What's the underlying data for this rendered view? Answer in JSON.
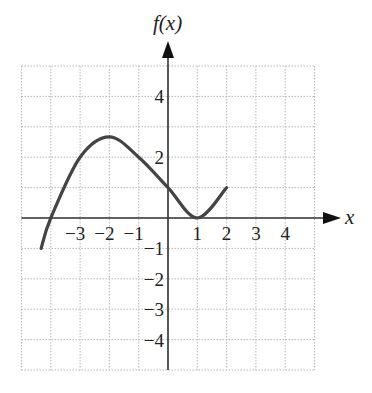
{
  "chart_data": {
    "type": "line",
    "title": "",
    "xlabel": "x",
    "ylabel": "f(x)",
    "xlim": [
      -5,
      5
    ],
    "ylim": [
      -5,
      5
    ],
    "grid": true,
    "x_ticks": [
      -3,
      -2,
      -1,
      1,
      2,
      3,
      4
    ],
    "y_ticks": [
      4,
      2,
      -1,
      -2,
      -3,
      -4
    ],
    "x_tick_labels": [
      "−3",
      "−2",
      "−1",
      "1",
      "2",
      "3",
      "4"
    ],
    "y_tick_labels": [
      "4",
      "2",
      "−1",
      "−2",
      "−3",
      "−4"
    ],
    "series": [
      {
        "name": "f(x)",
        "x": [
          -4.33,
          -4,
          -3,
          -2,
          -1,
          0,
          1,
          2
        ],
        "y": [
          -1,
          0,
          2,
          2.67,
          2,
          1,
          0,
          1
        ]
      }
    ]
  },
  "colors": {
    "curve": "#444444",
    "axis": "#333333",
    "grid": "#b8b8b8"
  }
}
